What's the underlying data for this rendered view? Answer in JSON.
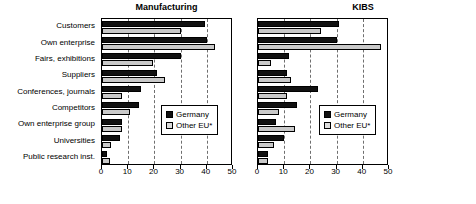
{
  "figure": {
    "categories": [
      "Customers",
      "Own enterprise",
      "Fairs, exhibitions",
      "Suppliers",
      "Conferences, journals",
      "Competitors",
      "Own enterprise group",
      "Universities",
      "Public research inst."
    ],
    "legend": {
      "series_1": "Germany",
      "series_2": "Other EU*"
    },
    "axis": {
      "ticks": [
        0,
        10,
        20,
        30,
        40,
        50
      ],
      "tick_labels": [
        "0",
        "10",
        "20",
        "30",
        "40",
        "50"
      ],
      "min": 0,
      "max": 50
    },
    "colors": {
      "germany": "#111111",
      "other_eu": "#c9c9c9",
      "gridline": "#6f6f6f",
      "axis": "#000000",
      "background": "#ffffff"
    }
  },
  "chart_data": [
    {
      "type": "bar",
      "title": "Manufacturing",
      "orientation": "horizontal",
      "categories": [
        "Customers",
        "Own enterprise",
        "Fairs, exhibitions",
        "Suppliers",
        "Conferences, journals",
        "Competitors",
        "Own enterprise group",
        "Universities",
        "Public research inst."
      ],
      "series": [
        {
          "name": "Germany",
          "values": [
            39.5,
            40,
            30,
            21,
            15,
            14,
            7.5,
            7,
            2
          ]
        },
        {
          "name": "Other EU*",
          "values": [
            30,
            43,
            19.5,
            24,
            7.5,
            10.5,
            7.5,
            3.5,
            3
          ]
        }
      ],
      "xlabel": "",
      "ylabel": "",
      "xlim": [
        0,
        50
      ],
      "grid": true,
      "legend_position": "center-right"
    },
    {
      "type": "bar",
      "title": "KIBS",
      "orientation": "horizontal",
      "categories": [
        "Customers",
        "Own enterprise",
        "Fairs, exhibitions",
        "Suppliers",
        "Conferences, journals",
        "Competitors",
        "Own enterprise group",
        "Universities",
        "Public research inst."
      ],
      "series": [
        {
          "name": "Germany",
          "values": [
            31,
            30,
            12,
            11,
            23,
            15,
            7,
            10,
            4
          ]
        },
        {
          "name": "Other EU*",
          "values": [
            24,
            47,
            5,
            12.5,
            11,
            8,
            14,
            6,
            4
          ]
        }
      ],
      "xlabel": "",
      "ylabel": "",
      "xlim": [
        0,
        50
      ],
      "grid": true,
      "legend_position": "center-right"
    }
  ]
}
